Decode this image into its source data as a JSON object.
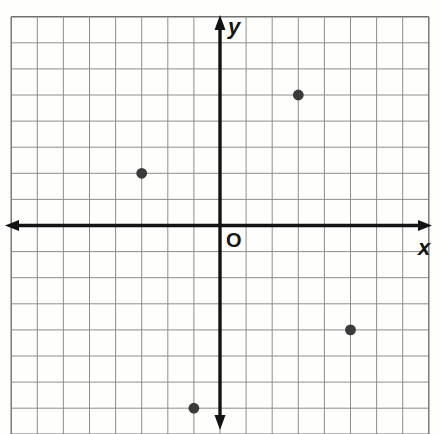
{
  "figure": {
    "origin_label": "O",
    "x_axis_label": "x",
    "y_axis_label": "y"
  },
  "chart_data": {
    "type": "scatter",
    "title": "",
    "xlabel": "x",
    "ylabel": "y",
    "origin_label": "O",
    "points": [
      {
        "x": 3,
        "y": 5
      },
      {
        "x": -3,
        "y": 2
      },
      {
        "x": 5,
        "y": -4
      },
      {
        "x": -1,
        "y": -7
      }
    ],
    "xlim": [
      -8,
      8
    ],
    "ylim": [
      -8,
      8
    ],
    "grid": true,
    "grid_cells": 16,
    "legend": "none",
    "colors": {
      "grid_line": "#8d8d8d",
      "grid_border": "#707070",
      "axis": "#131313",
      "point": "#3a3a3a",
      "paper": "#fefefc"
    }
  }
}
